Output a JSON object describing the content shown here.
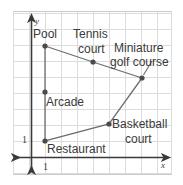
{
  "figure": {
    "frame": {
      "x": 13,
      "y": 11,
      "width": 159,
      "height": 164,
      "color": "#c9c9c9"
    },
    "grid": {
      "color": "#d8d8d8",
      "spacing": 16,
      "origin": {
        "x": 31,
        "y": 157
      },
      "show": true
    },
    "axes": {
      "color": "#3a3a3a",
      "x_label": "x",
      "y_label": "y",
      "x_tick_label": "1",
      "y_tick_label": "1",
      "x_axis_y": 157,
      "y_axis_x": 31
    },
    "polygon": {
      "stroke": "#5a5a5a",
      "vertex_color": "#4a4a4a",
      "closed": true,
      "points": [
        {
          "name": "pool",
          "label": "Pool",
          "x": 45,
          "y": 46
        },
        {
          "name": "tennis-court",
          "label": "Tennis court",
          "x": 93,
          "y": 62
        },
        {
          "name": "miniature-golf-course",
          "label": "Miniature golf course",
          "x": 142,
          "y": 78
        },
        {
          "name": "basketball-court",
          "label": "Basketball court",
          "x": 109,
          "y": 124
        },
        {
          "name": "restaurant",
          "label": "Restaurant",
          "x": 45,
          "y": 141
        }
      ]
    },
    "interior_points": [
      {
        "name": "arcade",
        "label": "Arcade",
        "x": 45,
        "y": 92
      }
    ],
    "leader_line": {
      "from": {
        "x": 152,
        "y": 62
      },
      "to": {
        "x": 143,
        "y": 75
      },
      "color": "#6a6a6a"
    },
    "labels": {
      "pool": "Pool",
      "tennis_line1": "Tennis",
      "tennis_line2": "court",
      "golf_line1": "Miniature",
      "golf_line2": "golf course",
      "arcade": "Arcade",
      "basketball_line1": "Basketball",
      "basketball_line2": "court",
      "restaurant": "Restaurant"
    }
  }
}
